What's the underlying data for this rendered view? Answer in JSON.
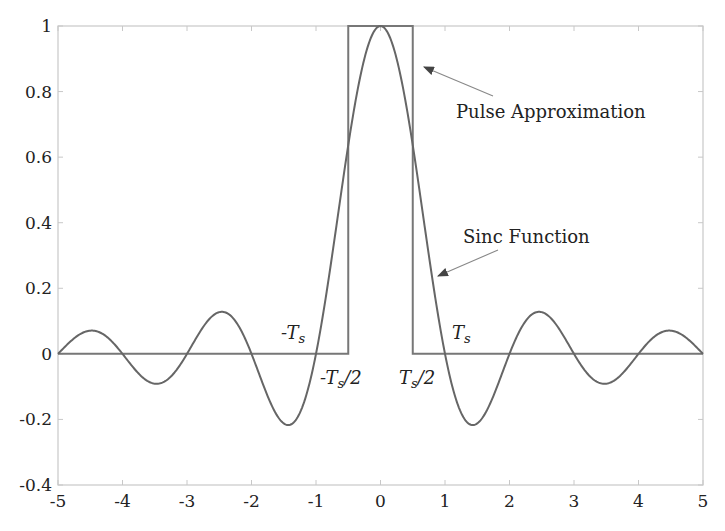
{
  "chart_data": {
    "type": "line",
    "title": "",
    "xlabel": "",
    "ylabel": "",
    "xlim": [
      -5,
      5
    ],
    "ylim": [
      -0.4,
      1
    ],
    "grid": false,
    "x_ticks": [
      "-5",
      "-4",
      "-3",
      "-2",
      "-1",
      "0",
      "1",
      "2",
      "3",
      "4",
      "5"
    ],
    "y_ticks": [
      "-0.4",
      "-0.2",
      "0",
      "0.2",
      "0.4",
      "0.6",
      "0.8",
      "1"
    ],
    "series": [
      {
        "name": "Sinc Function",
        "formula": "sin(pi x)/(pi x)",
        "x": [
          -5,
          -4.5,
          -4,
          -3.5,
          -3,
          -2.5,
          -2,
          -1.43,
          -1,
          -0.5,
          0,
          0.5,
          1,
          1.43,
          2,
          2.5,
          3,
          3.5,
          4,
          4.5,
          5
        ],
        "values": [
          0,
          0.071,
          0,
          -0.091,
          0,
          0.127,
          0,
          -0.217,
          0,
          0.637,
          1,
          0.637,
          0,
          -0.217,
          0,
          0.127,
          0,
          -0.091,
          0,
          0.071,
          0
        ]
      },
      {
        "name": "Pulse Approximation",
        "x": [
          -5,
          -0.5,
          -0.5,
          0.5,
          0.5,
          5
        ],
        "values": [
          0,
          0,
          1,
          1,
          0,
          0
        ]
      }
    ],
    "annotations": [
      {
        "text": "Pulse Approximation",
        "arrow_to": [
          0.5,
          0.88
        ]
      },
      {
        "text": "Sinc Function",
        "arrow_to": [
          0.85,
          0.23
        ]
      },
      {
        "text": "-Ts",
        "at": [
          -1,
          0.05
        ]
      },
      {
        "text": "Ts",
        "at": [
          1,
          0.05
        ]
      },
      {
        "text": "-Ts/2",
        "at": [
          -0.5,
          -0.05
        ]
      },
      {
        "text": "Ts/2",
        "at": [
          0.5,
          -0.05
        ]
      }
    ]
  },
  "labels": {
    "pulse": "Pulse Approximation",
    "sinc": "Sinc Function",
    "neg_ts_T": "-T",
    "ts_T": "T",
    "sub_s": "s",
    "neg_half_T": "-T",
    "half_T": "T",
    "half_suffix": "/2"
  }
}
